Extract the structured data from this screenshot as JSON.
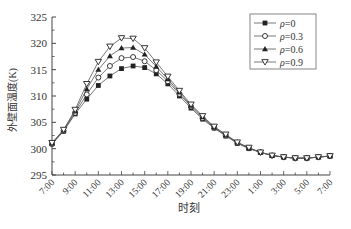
{
  "chart_data": {
    "type": "line",
    "title": "",
    "xlabel": "时刻",
    "ylabel": "外壁面温度(K)",
    "ylim": [
      295,
      325
    ],
    "yticks": [
      295,
      300,
      305,
      310,
      315,
      320,
      325
    ],
    "grid": false,
    "legend_position": "upper right",
    "x": [
      "7:00",
      "8:00",
      "9:00",
      "10:00",
      "11:00",
      "12:00",
      "13:00",
      "14:00",
      "15:00",
      "16:00",
      "17:00",
      "18:00",
      "19:00",
      "20:00",
      "21:00",
      "22:00",
      "23:00",
      "0:00",
      "1:00",
      "2:00",
      "3:00",
      "4:00",
      "5:00",
      "6:00",
      "7:00"
    ],
    "xtick_labels": [
      "7:00",
      "9:00",
      "11:00",
      "13:00",
      "15:00",
      "17:00",
      "19:00",
      "21:00",
      "23:00",
      "1:00",
      "3:00",
      "5:00",
      "7:00"
    ],
    "series": [
      {
        "name": "ρ=0",
        "marker": "filled-square",
        "values": [
          300.9,
          303.3,
          306.6,
          309.4,
          312.0,
          313.8,
          315.2,
          315.7,
          315.4,
          314.2,
          312.3,
          310.0,
          307.7,
          305.6,
          303.9,
          302.4,
          301.0,
          300.0,
          299.3,
          298.7,
          298.4,
          298.2,
          298.2,
          298.4,
          298.6
        ]
      },
      {
        "name": "ρ=0.3",
        "marker": "open-circle",
        "values": [
          300.9,
          303.4,
          306.8,
          310.3,
          313.5,
          315.7,
          317.2,
          317.4,
          316.6,
          314.9,
          312.8,
          310.4,
          308.0,
          305.8,
          304.0,
          302.5,
          301.1,
          300.1,
          299.3,
          298.7,
          298.4,
          298.2,
          298.2,
          298.4,
          298.6
        ]
      },
      {
        "name": "ρ=0.6",
        "marker": "filled-triangle",
        "values": [
          301.0,
          303.5,
          307.1,
          311.3,
          315.0,
          317.6,
          319.1,
          319.2,
          317.9,
          315.6,
          313.2,
          310.7,
          308.2,
          306.0,
          304.1,
          302.6,
          301.2,
          300.1,
          299.3,
          298.7,
          298.4,
          298.2,
          298.2,
          298.4,
          298.6
        ]
      },
      {
        "name": "ρ=0.9",
        "marker": "open-down-triangle",
        "values": [
          301.1,
          303.6,
          307.4,
          312.3,
          316.5,
          319.4,
          321.0,
          320.9,
          319.1,
          316.4,
          313.7,
          311.0,
          308.4,
          306.2,
          304.2,
          302.7,
          301.2,
          300.2,
          299.3,
          298.7,
          298.4,
          298.2,
          298.2,
          298.4,
          298.6
        ]
      }
    ]
  },
  "legend": {
    "items": [
      {
        "prefix": "ρ",
        "label": "=0"
      },
      {
        "prefix": "ρ",
        "label": "=0.3"
      },
      {
        "prefix": "ρ",
        "label": "=0.6"
      },
      {
        "prefix": "ρ",
        "label": "=0.9"
      }
    ]
  },
  "colors": {
    "line": "#555555",
    "marker": "#222222",
    "axis": "#444444"
  }
}
